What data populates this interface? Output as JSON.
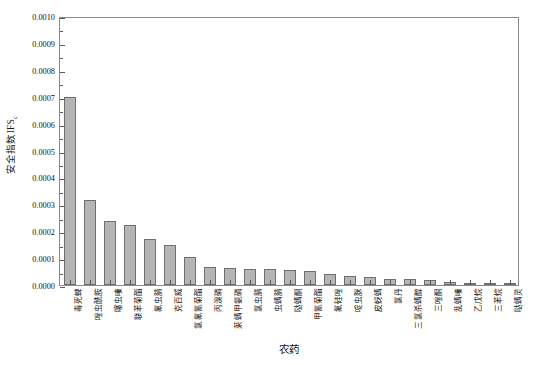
{
  "chart_data": {
    "type": "bar",
    "title": "",
    "xlabel": "农药",
    "ylabel": "安全指数IFS",
    "ylabel_sub": "c",
    "ylim": [
      0.0,
      0.001
    ],
    "ytick_labels": [
      "0.0000",
      "0.0001",
      "0.0002",
      "0.0003",
      "0.0004",
      "0.0005",
      "0.0006",
      "0.0007",
      "0.0008",
      "0.0009",
      "0.0010"
    ],
    "ytick_values": [
      0.0,
      0.0001,
      0.0002,
      0.0003,
      0.0004,
      0.0005,
      0.0006,
      0.0007,
      0.0008,
      0.0009,
      0.001
    ],
    "grid": false,
    "legend": "none",
    "bar_fill": "#b5b5b5",
    "bar_edge": "#6e6e6e",
    "categories": [
      "毒死蜱",
      "唑虫酰胺",
      "噻虫嗪",
      "联苯菊酯",
      "氟虫腈",
      "克百威",
      "氯氟氰菊酯",
      "丙溴磷",
      "莱螨甲氨磷",
      "氯虫腈",
      "虫螨腈",
      "哒螨酮",
      "甲氰菊酯",
      "氟硅唑",
      "啶虫脒",
      "皮蚜螨",
      "氯丹",
      "三氯杀螨醇",
      "三唑酮",
      "乱螨嗪",
      "乙戊烷",
      "三苯烷",
      "哒螨灵"
    ],
    "values": [
      0.0007,
      0.000315,
      0.000238,
      0.000222,
      0.000172,
      0.00015,
      0.000103,
      6.8e-05,
      6.3e-05,
      6e-05,
      5.8e-05,
      5.5e-05,
      5.2e-05,
      4e-05,
      3.5e-05,
      3e-05,
      2.4e-05,
      2.2e-05,
      1.8e-05,
      1e-05,
      8e-06,
      5e-06,
      3e-06
    ]
  }
}
